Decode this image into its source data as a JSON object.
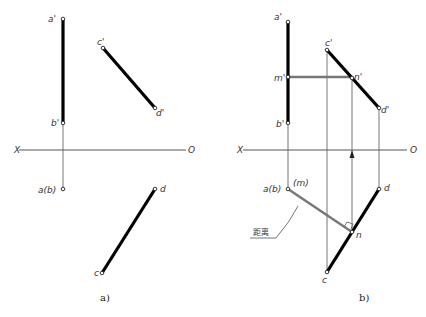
{
  "diagram_a": {
    "caption": "a)",
    "axis": {
      "left_label": "X",
      "right_label": "O"
    },
    "points": {
      "a_prime": "a'",
      "b_prime": "b'",
      "c_prime": "c'",
      "d_prime": "d'",
      "ab": "a(b)",
      "c": "c",
      "d": "d"
    }
  },
  "diagram_b": {
    "caption": "b)",
    "axis": {
      "left_label": "X",
      "right_label": "O"
    },
    "points": {
      "a_prime": "a'",
      "b_prime": "b'",
      "m_prime": "m'",
      "n_prime": "n'",
      "c_prime": "c'",
      "d_prime": "d'",
      "ab": "a(b)",
      "m": "(m)",
      "n": "n",
      "c": "c",
      "d": "d"
    },
    "annotation": "距离"
  }
}
